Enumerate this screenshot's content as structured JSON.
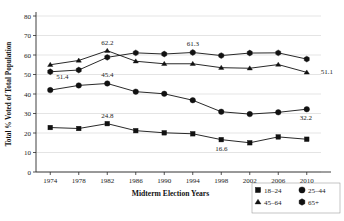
{
  "chart_data": {
    "type": "line",
    "title": "",
    "xlabel": "Midterm Election Years",
    "ylabel": "Total % Voted of Total Population",
    "categories": [
      "1974",
      "1978",
      "1982",
      "1986",
      "1990",
      "1994",
      "1998",
      "2002",
      "2006",
      "2010"
    ],
    "ylim": [
      0,
      80
    ],
    "yticks": [
      "0",
      "10",
      "20",
      "30",
      "40",
      "50",
      "60",
      "70",
      "80"
    ],
    "grid": true,
    "legend_position": "bottom-right",
    "series": [
      {
        "name": "18–24",
        "marker": "square",
        "values": [
          22.8,
          22.3,
          24.8,
          21.2,
          20.1,
          19.6,
          16.6,
          15.0,
          18.0,
          16.8
        ]
      },
      {
        "name": "25–44",
        "marker": "circle",
        "values": [
          42.0,
          44.4,
          45.4,
          41.2,
          40.1,
          36.8,
          30.9,
          29.7,
          30.6,
          32.2
        ]
      },
      {
        "name": "45–64",
        "marker": "triangle",
        "values": [
          55.0,
          57.2,
          62.2,
          56.8,
          55.5,
          55.5,
          53.5,
          53.2,
          55.1,
          51.1
        ]
      },
      {
        "name": "65+",
        "marker": "hexagon",
        "values": [
          51.4,
          52.3,
          58.8,
          61.1,
          60.5,
          61.3,
          59.7,
          61.0,
          61.1,
          57.9
        ]
      }
    ],
    "annotations": [
      {
        "label": "51.4",
        "series": "65+",
        "category": "1974",
        "value": 51.4,
        "dx": 6,
        "dy": 7
      },
      {
        "label": "62.2",
        "series": "45–64",
        "category": "1982",
        "value": 62.2,
        "dx": 0,
        "dy": -6
      },
      {
        "label": "45.4",
        "series": "25–44",
        "category": "1982",
        "value": 45.4,
        "dx": 0,
        "dy": -6
      },
      {
        "label": "24.8",
        "series": "18–24",
        "category": "1982",
        "value": 24.8,
        "dx": 0,
        "dy": -6
      },
      {
        "label": "61.3",
        "series": "65+",
        "category": "1994",
        "value": 61.3,
        "dx": 0,
        "dy": -6
      },
      {
        "label": "16.6",
        "series": "18–24",
        "category": "1998",
        "value": 16.6,
        "dx": 0,
        "dy": 11
      },
      {
        "label": "51.1",
        "series": "45–64",
        "category": "2010",
        "value": 51.1,
        "dx": 14,
        "dy": 2
      },
      {
        "label": "32.2",
        "series": "25–44",
        "category": "2010",
        "value": 32.2,
        "dx": -1,
        "dy": 11
      }
    ]
  },
  "legend": {
    "items": [
      {
        "label": "18–24",
        "marker": "square"
      },
      {
        "label": "25–44",
        "marker": "circle"
      },
      {
        "label": "45–64",
        "marker": "triangle"
      },
      {
        "label": "65+",
        "marker": "hexagon"
      }
    ]
  },
  "colors": {
    "series": "#111111",
    "grid": "#c9c9c9",
    "axis": "#2a2a2a",
    "background": "#ffffff",
    "text": "#1a1a1a"
  }
}
